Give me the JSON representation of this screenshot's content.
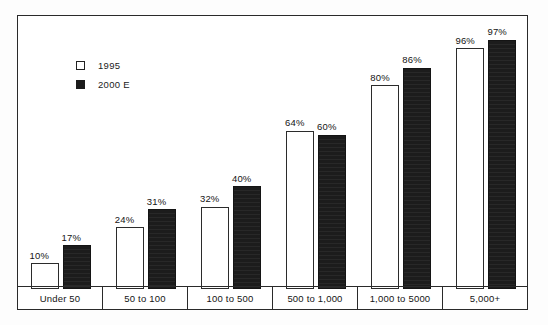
{
  "chart_data": {
    "type": "bar",
    "title": "",
    "subtitle": "",
    "xlabel": "",
    "ylabel": "",
    "ylim": [
      0,
      100
    ],
    "grid": false,
    "legend_position": "upper-left-inside",
    "categories": [
      "Under 50",
      "50 to 100",
      "100 to 500",
      "500 to 1,000",
      "1,000 to 5000",
      "5,000+"
    ],
    "series": [
      {
        "name": "1995",
        "color": "#ffffff",
        "values": [
          10,
          24,
          32,
          64,
          80,
          96
        ],
        "value_labels": [
          "10%",
          "24%",
          "32%",
          "64%",
          "80%",
          "96%"
        ]
      },
      {
        "name": "2000 E",
        "color": "#1c1c1c",
        "values": [
          17,
          31,
          40,
          60,
          86,
          97
        ],
        "value_labels": [
          "17%",
          "31%",
          "40%",
          "60%",
          "86%",
          "97%"
        ]
      }
    ]
  },
  "legend": {
    "items": [
      {
        "label": "1995",
        "swatch": "white-square"
      },
      {
        "label": "2000 E",
        "swatch": "black-square"
      }
    ]
  },
  "colors": {
    "frame": "#2a2a2a",
    "series_1995": "#ffffff",
    "series_2000e": "#1c1c1c",
    "text": "#141414",
    "background": "#ffffff"
  }
}
